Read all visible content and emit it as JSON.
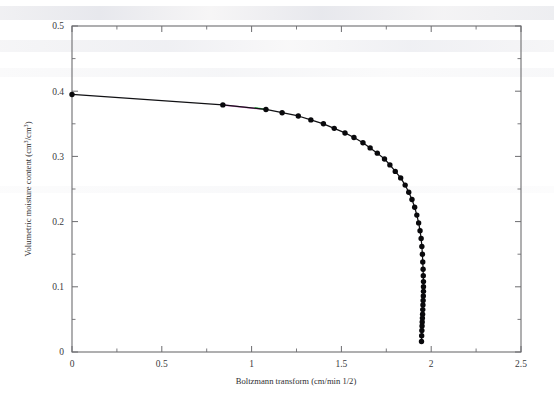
{
  "figure": {
    "background_color": "#ffffff",
    "frame_color": "#6d6d70",
    "marker_color": "#09090c",
    "line_color": "#111114",
    "artifact_colors": [
      "#c840b8",
      "#2fd24f"
    ]
  },
  "chart_data": {
    "type": "scatter",
    "title": "",
    "subtitle": "",
    "xlabel": "Boltzmann transform (cm/min 1/2)",
    "ylabel": "Volumetric moisture content (cm³/cm³)",
    "xlim": [
      0,
      2.5
    ],
    "ylim": [
      0,
      0.5
    ],
    "grid": false,
    "legend": null,
    "legend_position": "none",
    "x_major_ticks": [
      0,
      0.5,
      1,
      1.5,
      2,
      2.5
    ],
    "x_major_tick_labels": [
      "0",
      "0.5",
      "1",
      "1.5",
      "2",
      "2.5"
    ],
    "x_minor_ticks": [
      0.25,
      0.75,
      1.25,
      1.75,
      2.25
    ],
    "y_major_ticks": [
      0,
      0.1,
      0.2,
      0.3,
      0.4,
      0.5
    ],
    "y_major_tick_labels": [
      "0",
      "0.1",
      "0.2",
      "0.3",
      "0.4",
      "0.5"
    ],
    "y_minor_ticks": [
      0.05,
      0.15,
      0.25,
      0.35,
      0.45
    ],
    "marker_style": "filled-circle",
    "line_style": "solid-connecting-line",
    "series": [
      {
        "name": "moisture profile",
        "x": [
          0.0,
          0.84,
          1.08,
          1.17,
          1.26,
          1.33,
          1.4,
          1.46,
          1.52,
          1.57,
          1.62,
          1.66,
          1.7,
          1.74,
          1.77,
          1.8,
          1.83,
          1.855,
          1.875,
          1.893,
          1.908,
          1.92,
          1.93,
          1.938,
          1.944,
          1.948,
          1.951,
          1.953,
          1.955,
          1.956,
          1.957,
          1.957,
          1.957,
          1.956,
          1.955,
          1.954,
          1.953,
          1.952,
          1.951,
          1.95,
          1.949,
          1.948,
          1.947,
          1.946
        ],
        "y": [
          0.395,
          0.379,
          0.372,
          0.367,
          0.362,
          0.356,
          0.35,
          0.343,
          0.336,
          0.329,
          0.321,
          0.313,
          0.305,
          0.296,
          0.287,
          0.277,
          0.267,
          0.256,
          0.245,
          0.234,
          0.222,
          0.21,
          0.198,
          0.186,
          0.174,
          0.162,
          0.15,
          0.138,
          0.127,
          0.117,
          0.108,
          0.1,
          0.093,
          0.086,
          0.079,
          0.072,
          0.065,
          0.058,
          0.052,
          0.046,
          0.04,
          0.033,
          0.025,
          0.016
        ]
      }
    ]
  }
}
